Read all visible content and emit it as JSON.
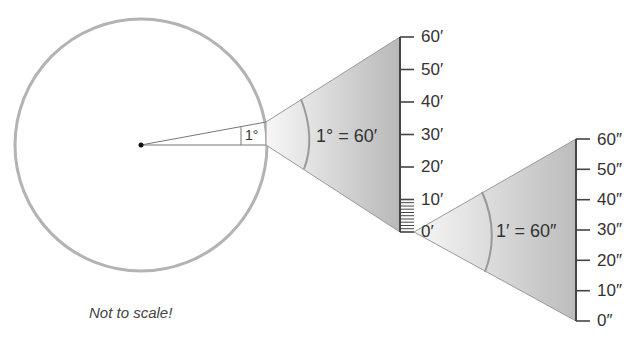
{
  "diagram": {
    "angle_label": "1°",
    "equation_degree": "1° = 60′",
    "equation_minute": "1′ = 60″",
    "note": "Not to scale!",
    "minute_scale_ticks": [
      "60′",
      "50′",
      "40′",
      "30′",
      "20′",
      "10′",
      "0′"
    ],
    "second_scale_ticks": [
      "60″",
      "50″",
      "40″",
      "30″",
      "20″",
      "10″",
      "0″"
    ],
    "colors": {
      "circle": "#b3b3b3",
      "wedge_fill_light": "#f2f2f2",
      "wedge_fill_dark": "#bdbdbd",
      "lines": "#555555"
    }
  }
}
